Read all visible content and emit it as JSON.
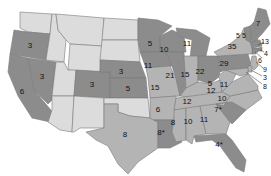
{
  "map": {
    "title": "",
    "colors": {
      "dark": "#8c8c8c",
      "mid": "#b4b4b4",
      "light": "#dcdcdc",
      "border": "#7a7a7a",
      "text": "#111111"
    },
    "states": [
      {
        "id": "WA",
        "value": "",
        "shade": "light"
      },
      {
        "id": "OR",
        "value": "3",
        "shade": "dark"
      },
      {
        "id": "CA",
        "value": "6",
        "shade": "dark"
      },
      {
        "id": "NV",
        "value": "3",
        "shade": "dark"
      },
      {
        "id": "ID",
        "value": "",
        "shade": "light"
      },
      {
        "id": "MT",
        "value": "",
        "shade": "light"
      },
      {
        "id": "WY",
        "value": "",
        "shade": "light"
      },
      {
        "id": "UT",
        "value": "",
        "shade": "light"
      },
      {
        "id": "AZ",
        "value": "",
        "shade": "light"
      },
      {
        "id": "CO",
        "value": "3",
        "shade": "dark"
      },
      {
        "id": "NM",
        "value": "",
        "shade": "light"
      },
      {
        "id": "ND",
        "value": "",
        "shade": "light"
      },
      {
        "id": "SD",
        "value": "",
        "shade": "light"
      },
      {
        "id": "NE",
        "value": "3",
        "shade": "dark"
      },
      {
        "id": "KS",
        "value": "5",
        "shade": "dark"
      },
      {
        "id": "OK",
        "value": "",
        "shade": "light"
      },
      {
        "id": "TX",
        "value": "8",
        "shade": "mid"
      },
      {
        "id": "MN",
        "value": "5",
        "shade": "dark"
      },
      {
        "id": "IA",
        "value": "11",
        "shade": "dark"
      },
      {
        "id": "MO",
        "value": "15",
        "shade": "mid"
      },
      {
        "id": "AR",
        "value": "6",
        "shade": "mid"
      },
      {
        "id": "LA",
        "value": "8*",
        "shade": "dark"
      },
      {
        "id": "WI",
        "value": "10",
        "shade": "dark"
      },
      {
        "id": "IL",
        "value": "21",
        "shade": "dark"
      },
      {
        "id": "MI",
        "value": "11",
        "shade": "dark"
      },
      {
        "id": "IN",
        "value": "15",
        "shade": "mid"
      },
      {
        "id": "OH",
        "value": "22",
        "shade": "dark"
      },
      {
        "id": "KY",
        "value": "12",
        "shade": "mid"
      },
      {
        "id": "TN",
        "value": "12",
        "shade": "mid"
      },
      {
        "id": "MS",
        "value": "8",
        "shade": "mid"
      },
      {
        "id": "AL",
        "value": "10",
        "shade": "mid"
      },
      {
        "id": "GA",
        "value": "11",
        "shade": "mid"
      },
      {
        "id": "FL",
        "value": "4*",
        "shade": "dark"
      },
      {
        "id": "SC",
        "value": "7*",
        "shade": "dark"
      },
      {
        "id": "NC",
        "value": "10",
        "shade": "mid"
      },
      {
        "id": "VA",
        "value": "11",
        "shade": "mid"
      },
      {
        "id": "WV",
        "value": "5",
        "shade": "mid"
      },
      {
        "id": "PA",
        "value": "29",
        "shade": "dark"
      },
      {
        "id": "NY",
        "value": "35",
        "shade": "mid"
      },
      {
        "id": "VT",
        "value": "5",
        "shade": "dark"
      },
      {
        "id": "NH",
        "value": "5",
        "shade": "dark"
      },
      {
        "id": "ME",
        "value": "7",
        "shade": "dark"
      },
      {
        "id": "MA",
        "value": "13",
        "shade": "dark"
      },
      {
        "id": "RI",
        "value": "4",
        "shade": "dark"
      },
      {
        "id": "CT",
        "value": "6",
        "shade": "dark"
      },
      {
        "id": "NJ",
        "value": "9",
        "shade": "mid"
      },
      {
        "id": "DE",
        "value": "3",
        "shade": "mid"
      },
      {
        "id": "MD",
        "value": "8",
        "shade": "mid"
      }
    ]
  }
}
